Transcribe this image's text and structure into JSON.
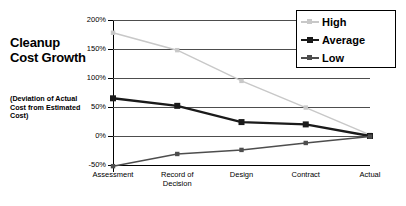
{
  "chart_data": {
    "type": "line",
    "title": "Cleanup Cost Growth",
    "subtitle": "(Deviation of Actual Cost from Estimated Cost)",
    "xlabel": "",
    "ylabel": "",
    "categories": [
      "Assessment",
      "Record of Decision",
      "Design",
      "Contract",
      "Actual"
    ],
    "ylim": [
      -50,
      200
    ],
    "yticks": [
      200,
      150,
      100,
      50,
      0,
      -50
    ],
    "ytick_labels": [
      "200%",
      "150%",
      "100%",
      "50%",
      "0%",
      "-50%"
    ],
    "grid": true,
    "legend_position": "top-right",
    "series": [
      {
        "name": "High",
        "color": "#c8c8c8",
        "values": [
          178,
          148,
          95,
          49,
          2
        ]
      },
      {
        "name": "Average",
        "color": "#1a1a1a",
        "values": [
          65,
          52,
          24,
          20,
          0
        ]
      },
      {
        "name": "Low",
        "color": "#4d4d4d",
        "values": [
          -52,
          -31,
          -24,
          -12,
          -1
        ]
      }
    ]
  },
  "legend": {
    "entries": [
      {
        "label": "High"
      },
      {
        "label": "Average"
      },
      {
        "label": "Low"
      }
    ]
  },
  "axis": {
    "x_labels": [
      {
        "line1": "Assessment",
        "line2": ""
      },
      {
        "line1": "Record of",
        "line2": "Decision"
      },
      {
        "line1": "Design",
        "line2": ""
      },
      {
        "line1": "Contract",
        "line2": ""
      },
      {
        "line1": "Actual",
        "line2": ""
      }
    ],
    "y_labels": [
      "200%",
      "150%",
      "100%",
      "50%",
      "0%",
      "-50%"
    ]
  }
}
